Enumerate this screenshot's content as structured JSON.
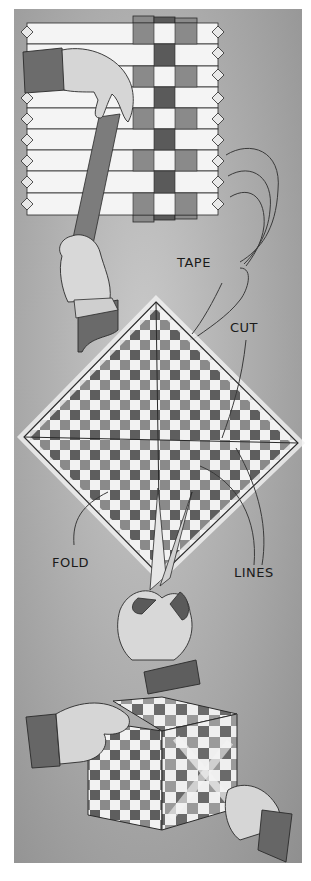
{
  "illustration": {
    "style": "grayscale instructional drawing",
    "steps": [
      {
        "name": "weave-strips",
        "description": "hands weaving paper strips into a mat"
      },
      {
        "name": "cut-and-fold",
        "description": "woven square turned as diamond, cut with scissors"
      },
      {
        "name": "assemble-box",
        "description": "hands assembling woven cube"
      }
    ],
    "labels": {
      "tape": "TAPE",
      "cut": "CUT",
      "fold": "FOLD",
      "lines": "LINES"
    },
    "colors": {
      "background": "#a9a9a9",
      "strip_light": "#f4f4f4",
      "strip_mid": "#8a8a8a",
      "strip_dark": "#5a5a5a",
      "outline": "#2a2a2a"
    }
  }
}
